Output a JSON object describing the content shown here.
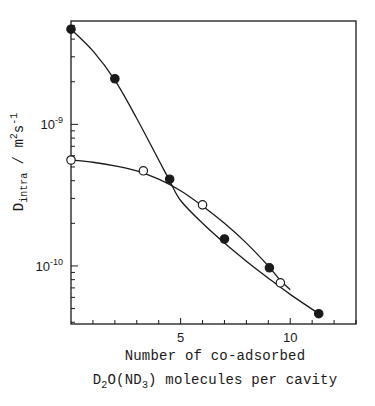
{
  "chart_data": {
    "type": "scatter",
    "title": "",
    "xlabel": {
      "line1": "Number of co-adsorbed",
      "line2_prefix": "D",
      "line2_sub1": "2",
      "line2_mid": "O(ND",
      "line2_sub2": "3",
      "line2_suffix": ") molecules per cavity"
    },
    "ylabel": {
      "main": "D",
      "sub": "intra",
      "unit_prefix": " / m",
      "unit_sup1": "2",
      "unit_mid": "s",
      "unit_sup2": "-1"
    },
    "xlim": [
      0,
      13
    ],
    "ylim_log10": [
      -10.41,
      -8.27
    ],
    "yscale": "log",
    "xticks_major": [
      5,
      10
    ],
    "xtick_labels": [
      "5",
      "10"
    ],
    "xticks_minor_step": 1,
    "yticks_major": [
      {
        "exp": -9,
        "label_base": "10",
        "label_exp": "-9"
      },
      {
        "exp": -10,
        "label_base": "10",
        "label_exp": "-10"
      }
    ],
    "grid": false,
    "legend": null,
    "series": [
      {
        "name": "filled circles",
        "marker": "filled-circle",
        "x": [
          0,
          2.0,
          4.5,
          7.0,
          9.05,
          11.3
        ],
        "y": [
          4.7e-09,
          2.1e-09,
          4.1e-10,
          1.55e-10,
          9.7e-11,
          4.6e-11
        ]
      },
      {
        "name": "open circles",
        "marker": "open-circle",
        "x": [
          0,
          3.3,
          6.0,
          9.55
        ],
        "y": [
          5.6e-10,
          4.7e-10,
          2.7e-10,
          7.6e-11
        ]
      }
    ],
    "curves": [
      {
        "name": "fit-filled",
        "x": [
          0,
          1,
          2,
          3,
          4,
          4.5,
          5,
          6,
          7,
          8,
          9,
          10,
          11.3
        ],
        "y": [
          4.7e-09,
          3.3e-09,
          2.05e-09,
          1.1e-09,
          5.6e-10,
          4e-10,
          2.9e-10,
          2e-10,
          1.45e-10,
          1.08e-10,
          8.2e-11,
          6.3e-11,
          4.6e-11
        ]
      },
      {
        "name": "fit-open",
        "x": [
          0,
          1,
          2,
          3,
          4,
          5,
          6,
          7,
          8,
          9,
          9.55,
          10
        ],
        "y": [
          5.6e-10,
          5.4e-10,
          5.1e-10,
          4.7e-10,
          4.1e-10,
          3.4e-10,
          2.65e-10,
          2e-10,
          1.45e-10,
          1e-10,
          7.9e-11,
          6.8e-11
        ]
      }
    ]
  },
  "colors": {
    "ink": "#1a1a1a",
    "background": "#ffffff"
  }
}
